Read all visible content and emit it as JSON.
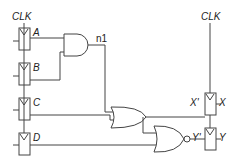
{
  "diagram": {
    "type": "sequential-logic-circuit",
    "clock_labels": [
      "CLK",
      "CLK"
    ],
    "input_flipflops": [
      {
        "label": "A"
      },
      {
        "label": "B"
      },
      {
        "label": "C"
      },
      {
        "label": "D"
      }
    ],
    "gates": [
      {
        "type": "AND",
        "inputs": [
          "A",
          "B"
        ],
        "output": "n1"
      },
      {
        "type": "OR",
        "inputs": [
          "n1",
          "C"
        ],
        "output": "X'"
      },
      {
        "type": "NOR",
        "inputs": [
          "X'",
          "D"
        ],
        "output": "Y'"
      }
    ],
    "net_labels": {
      "n1": "n1"
    },
    "output_flipflops": [
      {
        "input_label": "X'",
        "output_label": "X"
      },
      {
        "input_label": "Y'",
        "output_label": "Y"
      }
    ]
  }
}
